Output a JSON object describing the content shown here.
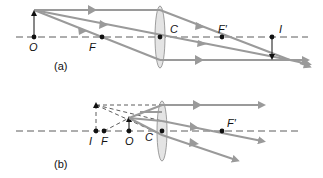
{
  "diagram": {
    "colors": {
      "ray": "#9a9a9a",
      "axis": "#333333",
      "point": "#111111",
      "lens_fill": "#e4e4e4",
      "lens_stroke": "#888888"
    },
    "panel_a": {
      "caption": "(a)",
      "labels": {
        "object": "O",
        "focal_near": "F",
        "center": "C",
        "focal_far": "F′",
        "image": "I"
      }
    },
    "panel_b": {
      "caption": "(b)",
      "labels": {
        "image": "I",
        "focal_near": "F",
        "object": "O",
        "center": "C",
        "focal_far": "F′"
      }
    }
  }
}
